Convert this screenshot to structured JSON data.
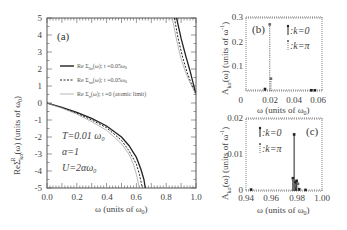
{
  "chart_data": [
    {
      "type": "line",
      "panel": "(a)",
      "xlabel": "ω (units of ω0)",
      "ylabel": "ReΣ^R_kσ(ω) (units of ω0)",
      "xlim": [
        0.0,
        1.0
      ],
      "ylim": [
        -5,
        5
      ],
      "xticks": [
        "0.0",
        "0.2",
        "0.4",
        "0.6",
        "0.8",
        "1.0"
      ],
      "yticks": [
        "5",
        "4",
        "3",
        "2",
        "1",
        "0",
        "-1",
        "-2",
        "-3",
        "-4",
        "-5"
      ],
      "legend": [
        "Re Σ^R_0σ(ω); t=0.05ω0",
        "Re Σ^R_πσ(ω); t=0.05ω0",
        "Re Σ^R_σ(ω); t=0 (atomic limit)"
      ],
      "annotations": [
        "T=0.01 ω0",
        "α=1",
        "U=2αω0"
      ],
      "series": [
        {
          "name": "Re Σ^R_0σ(ω); t=0.05ω0",
          "style": "solid-thick",
          "x": [
            0.0,
            0.1,
            0.2,
            0.3,
            0.4,
            0.5,
            0.55,
            0.6,
            0.63,
            0.65,
            0.66,
            0.87,
            0.9,
            0.93,
            0.96,
            0.98,
            1.0
          ],
          "y": [
            0.0,
            -0.25,
            -0.55,
            -0.9,
            -1.35,
            -2.0,
            -2.5,
            -3.2,
            -3.9,
            -4.5,
            -5.0,
            5.0,
            3.8,
            2.8,
            1.9,
            1.2,
            0.5
          ]
        },
        {
          "name": "Re Σ^R_πσ(ω); t=0.05ω0",
          "style": "dashed",
          "x": [
            0.0,
            0.1,
            0.2,
            0.3,
            0.4,
            0.5,
            0.55,
            0.6,
            0.62,
            0.64,
            0.855,
            0.88,
            0.91,
            0.94,
            0.97,
            1.0
          ],
          "y": [
            0.0,
            -0.27,
            -0.6,
            -1.0,
            -1.45,
            -2.2,
            -2.8,
            -3.6,
            -4.2,
            -5.0,
            5.0,
            3.8,
            2.7,
            1.8,
            1.1,
            0.5
          ]
        },
        {
          "name": "Re Σ^R_σ(ω); t=0 (atomic limit)",
          "style": "thin",
          "x": [
            0.0,
            0.1,
            0.2,
            0.3,
            0.4,
            0.5,
            0.55,
            0.58,
            0.6,
            0.62,
            0.84,
            0.87,
            0.9,
            0.93,
            0.96,
            1.0
          ],
          "y": [
            0.0,
            -0.3,
            -0.65,
            -1.1,
            -1.6,
            -2.4,
            -3.0,
            -3.6,
            -4.2,
            -5.0,
            5.0,
            3.7,
            2.6,
            1.8,
            1.2,
            0.5
          ]
        }
      ]
    },
    {
      "type": "bar",
      "panel": "(b)",
      "xlabel": "ω (units of ω0)",
      "ylabel": "A_kσ(ω) (units of ω0^-1)",
      "xlim": [
        0,
        0.064
      ],
      "ylim": [
        0,
        0.3
      ],
      "xticks": [
        "0",
        "0.02",
        "0.04",
        "0.06"
      ],
      "yticks": [
        "0.3",
        "0.2",
        "0.1",
        "0"
      ],
      "legend": [
        ":k=0",
        ":k=π"
      ],
      "series": [
        {
          "name": "k=0",
          "style": "solid",
          "x": [
            0.016,
            0.055,
            0.058
          ],
          "y": [
            0.008,
            0.003,
            0.003
          ]
        },
        {
          "name": "k=π",
          "style": "dotted",
          "x": [
            0.02,
            0.021
          ],
          "y": [
            0.27,
            0.05
          ]
        }
      ]
    },
    {
      "type": "bar",
      "panel": "(c)",
      "xlabel": "ω (units of ω0)",
      "ylabel": "A_kσ(ω) (units of ω0^-1)",
      "xlim": [
        0.94,
        1.0
      ],
      "ylim": [
        0,
        0.02
      ],
      "xticks": [
        "0.94",
        "0.96",
        "0.98",
        "1.00"
      ],
      "yticks": [
        "0.02",
        "0.01",
        "0"
      ],
      "legend": [
        ":k=0",
        ":k=π"
      ],
      "series": [
        {
          "name": "k=0",
          "style": "solid",
          "x": [
            0.944,
            0.977,
            0.978,
            0.979,
            0.98,
            0.982,
            0.987
          ],
          "y": [
            0.0004,
            0.0035,
            0.0155,
            0.0025,
            0.0028,
            0.0005,
            0.0003
          ]
        },
        {
          "name": "k=π",
          "style": "dotted",
          "x": [
            0.9775,
            0.9785,
            0.981
          ],
          "y": [
            0.003,
            0.0015,
            0.002
          ]
        }
      ]
    }
  ],
  "panel_a": {
    "label": "(a)",
    "yticks": [
      "5",
      "4",
      "3",
      "2",
      "1",
      "0",
      "-1",
      "-2",
      "-3",
      "-4",
      "-5"
    ],
    "xticks": [
      "0.0",
      "0.2",
      "0.4",
      "0.6",
      "0.8",
      "1.0"
    ],
    "xlabel": "ω   (units of ω",
    "xlabel_sub": "0",
    "ylabel_re": "ReΣ",
    "ylabel_sub": "kσ",
    "ylabel_sup": "R",
    "ylabel_rest": "(ω)  (units of ω",
    "legend": {
      "l1": "Re Σ",
      "l1_sub": "0σ",
      "l1_rest": "(ω); t =0.05ω",
      "l2": "Re Σ",
      "l2_sub": "πσ",
      "l2_rest": "(ω); t =0.05ω",
      "l3": "Re Σ",
      "l3_sub": "σ",
      "l3_rest": "(ω); t =0 (atomic limit)",
      "sup": "R",
      "zero": "0"
    },
    "ann_T": "T=0.01 ω",
    "ann_alpha": "α=1",
    "ann_U": "U=2αω",
    "zero": "0"
  },
  "panel_b": {
    "label": "(b)",
    "yticks": [
      "0.3",
      "0.2",
      "0.1",
      "0"
    ],
    "xticks": [
      "0.02",
      "0.04",
      "0.06"
    ],
    "xlabel": "ω (units of ω",
    "ylabel": "A",
    "ylabel_sub": "kσ",
    "ylabel_rest": "(ω) (units of ω",
    "ylabel_sup": "-1",
    "leg_k0": ":k=0",
    "leg_kpi": ":k=π",
    "zero": "0"
  },
  "panel_c": {
    "label": "(c)",
    "yticks": [
      "0.02",
      "0.01",
      "0"
    ],
    "xticks": [
      "0.94",
      "0.96",
      "0.98",
      "1.00"
    ],
    "xlabel": "ω (units of ω",
    "ylabel": "A",
    "ylabel_sub": "kσ",
    "ylabel_rest": "(ω) (units of ω",
    "ylabel_sup": "-1",
    "leg_k0": ":k=0",
    "leg_kpi": ":k=π",
    "zero": "0"
  }
}
